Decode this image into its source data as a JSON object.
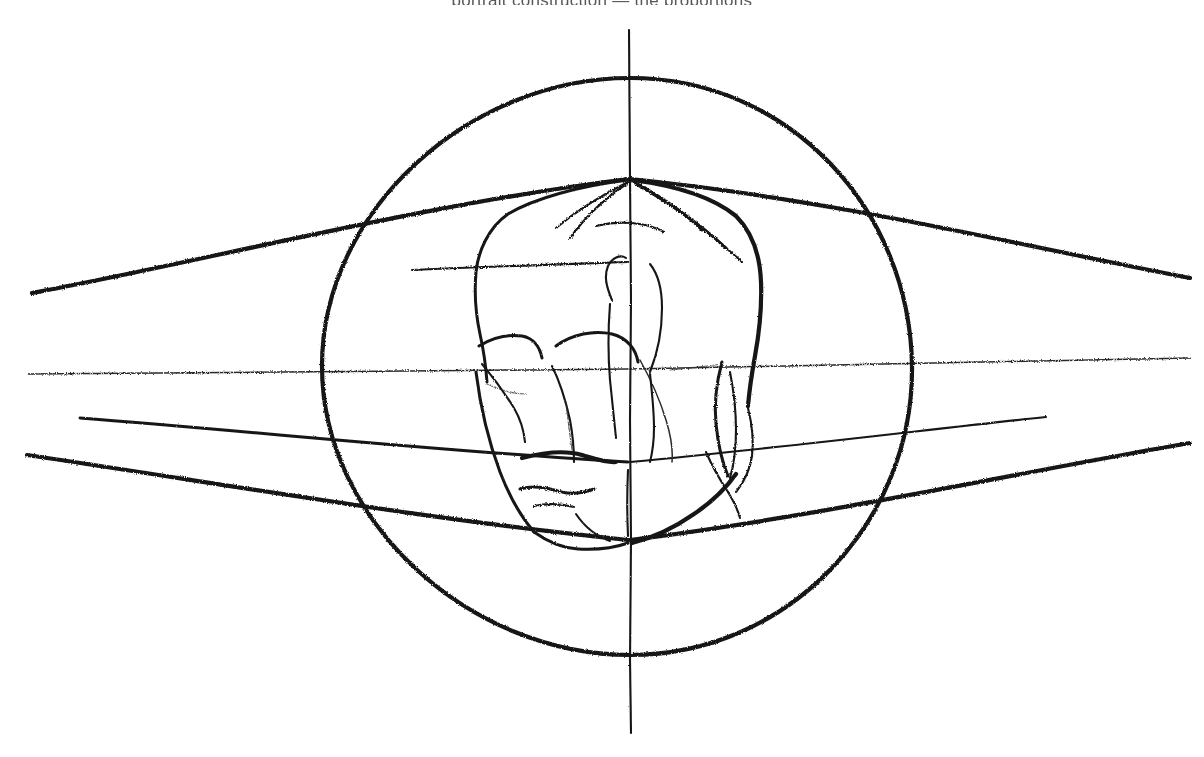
{
  "artwork": {
    "title": "Head Construction Study",
    "medium": "charcoal / graphite on white paper",
    "subject": "frontal human head with perspective construction lines",
    "background_color": "#ffffff",
    "stroke_color": "#151515",
    "canvas": {
      "width": 1204,
      "height": 757
    },
    "cropped_caption_text": "portrait construction — the proportions"
  },
  "construction": {
    "circle": {
      "label": "cranial-sphere",
      "center_x": 617,
      "center_y": 366,
      "radius": 290,
      "top_y": 78,
      "bottom_y": 655,
      "left_x": 322,
      "right_x": 912
    },
    "vertical_axis": {
      "label": "centerline",
      "x": 630,
      "top_y": 30,
      "bottom_y": 733
    },
    "horizon_lines": [
      {
        "name": "brow-perspective-line",
        "left": [
          32,
          293
        ],
        "mid": [
          630,
          178
        ],
        "right": [
          1190,
          278
        ]
      },
      {
        "name": "eye-line",
        "left": [
          28,
          374
        ],
        "mid": [
          630,
          368
        ],
        "right": [
          1190,
          358
        ]
      },
      {
        "name": "nose-base-line",
        "left": [
          80,
          418
        ],
        "mid": [
          630,
          462
        ],
        "right": [
          1046,
          417
        ]
      },
      {
        "name": "mouth-chin-line",
        "left": [
          27,
          455
        ],
        "mid": [
          630,
          540
        ],
        "right": [
          1190,
          443
        ]
      }
    ],
    "brow_tick": {
      "name": "short-brow-line",
      "x1": 412,
      "y1": 269,
      "x2": 628,
      "y2": 262
    }
  },
  "features": [
    {
      "name": "cranium-outline"
    },
    {
      "name": "crown-radiating-lines",
      "count": 5
    },
    {
      "name": "brow-ridge-left"
    },
    {
      "name": "brow-ridge-right"
    },
    {
      "name": "nose-bridge"
    },
    {
      "name": "nose-base"
    },
    {
      "name": "left-cheek-contour"
    },
    {
      "name": "right-cheek-contour"
    },
    {
      "name": "mouth-upper-lip"
    },
    {
      "name": "mouth-lower-lip"
    },
    {
      "name": "jaw-line"
    },
    {
      "name": "chin"
    },
    {
      "name": "right-ear"
    },
    {
      "name": "eye-socket-left"
    },
    {
      "name": "eye-socket-right"
    }
  ]
}
